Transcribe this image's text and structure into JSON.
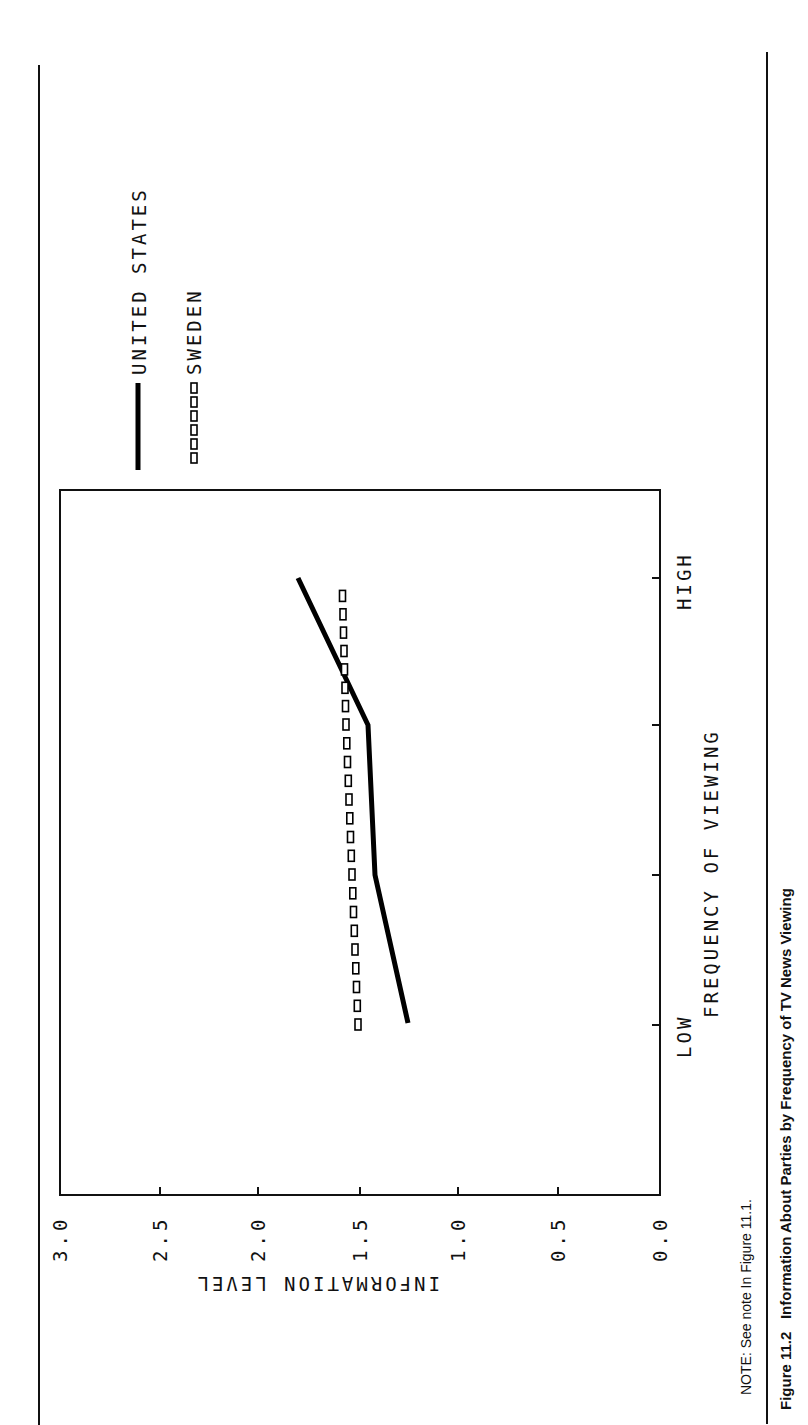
{
  "legend": {
    "items": [
      {
        "label": "UNITED STATES",
        "style": "solid"
      },
      {
        "label": "SWEDEN",
        "style": "open-squares"
      }
    ]
  },
  "axes": {
    "x_label": "FREQUENCY OF VIEWING",
    "x_low": "LOW",
    "x_high": "HIGH",
    "y_label": "INFORMATION LEVEL",
    "y_ticks": [
      "3.0",
      "2.5",
      "2.0",
      "1.5",
      "1.0",
      "0.5",
      "0.0"
    ]
  },
  "note": "NOTE: See note In Figure 11.1.",
  "caption": {
    "number": "Figure 11.2",
    "title": "Information About Parties by Frequency of TV News Viewing"
  },
  "chart_data": {
    "type": "line",
    "title": "Information About Parties by Frequency of TV News Viewing",
    "xlabel": "FREQUENCY OF VIEWING",
    "ylabel": "INFORMATION LEVEL",
    "categories": [
      "LOW",
      "2",
      "3",
      "HIGH"
    ],
    "series": [
      {
        "name": "UNITED STATES",
        "values": [
          1.26,
          1.42,
          1.46,
          1.81
        ],
        "style": "solid thick line"
      },
      {
        "name": "SWEDEN",
        "values": [
          1.51,
          1.54,
          1.57,
          1.59
        ],
        "style": "open square markers"
      }
    ],
    "ylim": [
      0.0,
      3.0
    ],
    "yticks": [
      0.0,
      0.5,
      1.0,
      1.5,
      2.0,
      2.5,
      3.0
    ],
    "grid": false,
    "legend_position": "top (outside plot)",
    "orientation": "page rotated 90° counter-clockwise"
  }
}
